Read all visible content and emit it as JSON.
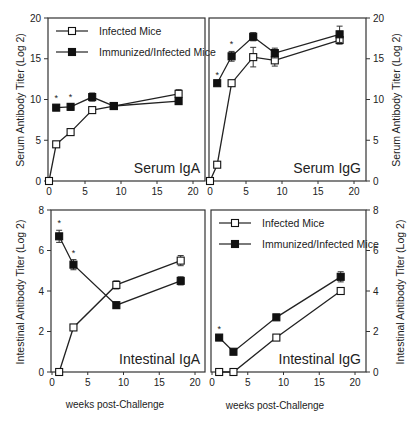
{
  "figure": {
    "x_label": "weeks post-Challenge",
    "left_y_label_top": "Serum Antibody Titer (Log 2)",
    "right_y_label_top": "Serum Antibody Titer (Log 2)",
    "left_y_label_bottom": "Intestinal Antibody Titer (Log 2)",
    "right_y_label_bottom": "Intestinal Antibody Titer (Log 2)",
    "legend": {
      "infected": "Infected  Mice",
      "immunized": "Immunized/Infected Mice"
    },
    "colors": {
      "line": "#222222",
      "open_marker_fill": "#ffffff",
      "filled_marker_fill": "#111111"
    }
  },
  "chart_data": [
    {
      "type": "line",
      "title": "Serum IgA",
      "xlabel": "",
      "ylabel": "Serum Antibody Titer (Log 2)",
      "xlim": [
        0,
        22
      ],
      "ylim": [
        0,
        20
      ],
      "xticks": [
        0,
        5,
        10,
        15,
        20
      ],
      "yticks": [
        0,
        5,
        10,
        15,
        20
      ],
      "legend_position": "upper-left",
      "series": [
        {
          "name": "Infected Mice",
          "marker": "open-square",
          "x": [
            0,
            1,
            3,
            6,
            9,
            18
          ],
          "y": [
            0,
            4.5,
            6,
            8.7,
            9.2,
            10.7
          ],
          "err": [
            0,
            0.2,
            0.2,
            0.3,
            0.3,
            0.5
          ]
        },
        {
          "name": "Immunized/Infected Mice",
          "marker": "filled-square",
          "x": [
            1,
            3,
            6,
            9,
            18
          ],
          "y": [
            9,
            9.1,
            10.3,
            9.2,
            9.8
          ],
          "err": [
            0.3,
            0.4,
            0.5,
            0.3,
            0.4
          ]
        }
      ],
      "annotations": [
        {
          "text": "*",
          "x": 1
        },
        {
          "text": "*",
          "x": 3
        }
      ]
    },
    {
      "type": "line",
      "title": "Serum IgG",
      "xlabel": "",
      "ylabel": "Serum Antibody Titer (Log 2)",
      "xlim": [
        0,
        22
      ],
      "ylim": [
        0,
        20
      ],
      "xticks": [
        0,
        5,
        10,
        15,
        20
      ],
      "yticks": [
        0,
        5,
        10,
        15,
        20
      ],
      "series": [
        {
          "name": "Infected Mice",
          "marker": "open-square",
          "x": [
            0,
            1,
            3,
            6,
            9,
            18
          ],
          "y": [
            0,
            2,
            12,
            15.2,
            14.8,
            17.3
          ],
          "err": [
            0,
            0.2,
            0.2,
            1.2,
            0.7,
            0.5
          ]
        },
        {
          "name": "Immunized/Infected Mice",
          "marker": "filled-square",
          "x": [
            1,
            3,
            6,
            9,
            18
          ],
          "y": [
            12,
            15.3,
            17.7,
            15.7,
            18
          ],
          "err": [
            0.2,
            0.6,
            0.5,
            0.6,
            1.0
          ]
        }
      ],
      "annotations": [
        {
          "text": "*",
          "x": 1
        },
        {
          "text": "*",
          "x": 3
        }
      ]
    },
    {
      "type": "line",
      "title": "Intestinal IgA",
      "xlabel": "weeks post-Challenge",
      "ylabel": "Intestinal Antibody Titer (Log 2)",
      "xlim": [
        0,
        22
      ],
      "ylim": [
        0,
        8
      ],
      "xticks": [
        0,
        5,
        10,
        15,
        20
      ],
      "yticks": [
        0,
        2,
        4,
        6,
        8
      ],
      "series": [
        {
          "name": "Infected Mice",
          "marker": "open-square",
          "x": [
            1,
            3,
            9,
            18
          ],
          "y": [
            0,
            2.2,
            4.3,
            5.5
          ],
          "err": [
            0,
            0.1,
            0.2,
            0.25
          ]
        },
        {
          "name": "Immunized/Infected Mice",
          "marker": "filled-square",
          "x": [
            1,
            3,
            9,
            18
          ],
          "y": [
            6.7,
            5.3,
            3.3,
            4.5
          ],
          "err": [
            0.3,
            0.25,
            0.15,
            0.2
          ]
        }
      ],
      "annotations": [
        {
          "text": "*",
          "x": 1
        },
        {
          "text": "*",
          "x": 3
        }
      ]
    },
    {
      "type": "line",
      "title": "Intestinal IgG",
      "xlabel": "weeks post-Challenge",
      "ylabel": "Intestinal Antibody Titer (Log 2)",
      "xlim": [
        0,
        22
      ],
      "ylim": [
        0,
        8
      ],
      "xticks": [
        0,
        5,
        10,
        15,
        20
      ],
      "yticks": [
        0,
        2,
        4,
        6,
        8
      ],
      "legend_position": "upper-left",
      "series": [
        {
          "name": "Infected Mice",
          "marker": "open-square",
          "x": [
            1,
            3,
            9,
            18
          ],
          "y": [
            0,
            0,
            1.7,
            4
          ],
          "err": [
            0,
            0,
            0.1,
            0.15
          ]
        },
        {
          "name": "Immunized/Infected Mice",
          "marker": "filled-square",
          "x": [
            1,
            3,
            9,
            18
          ],
          "y": [
            1.7,
            1,
            2.7,
            4.7
          ],
          "err": [
            0.1,
            0.1,
            0.1,
            0.25
          ]
        }
      ],
      "annotations": [
        {
          "text": "*",
          "x": 1
        }
      ]
    }
  ]
}
